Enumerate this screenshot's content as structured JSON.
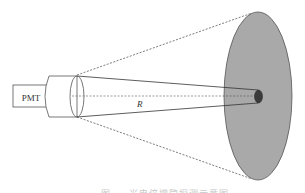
{
  "diagram": {
    "pmt_label": "PMT",
    "distance_label": "R",
    "caption": "图 — 光电倍增管探测示意图",
    "colors": {
      "line": "#333333",
      "disk_fill": "#a8a8a8",
      "spot_fill": "#3a3a3a",
      "background": "#ffffff"
    }
  }
}
